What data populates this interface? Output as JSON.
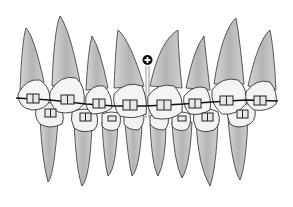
{
  "figure": {
    "colors": {
      "root": "#bdbdbd",
      "root_light": "#e2e2e2",
      "crown": "#f4f4f4",
      "outline": "#333333",
      "archwire": "#111111",
      "bracket": "#555555",
      "background": "#ffffff"
    },
    "upper_teeth_count": 8,
    "lower_teeth_count": 8,
    "midline_marker": "plus-circle",
    "caption": ""
  }
}
